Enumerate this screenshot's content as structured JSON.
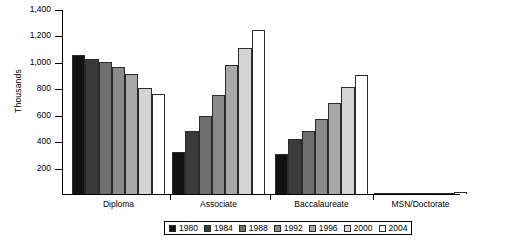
{
  "chart_data": {
    "type": "bar",
    "title": "",
    "xlabel": "",
    "ylabel": "Thousands",
    "ylim": [
      0,
      1400
    ],
    "ytick_step": 200,
    "grid": false,
    "legend_position": "bottom",
    "categories": [
      "Diploma",
      "Associate",
      "Baccalaureate",
      "MSN/Doctorate"
    ],
    "ytick_labels": [
      "1,400",
      "1,200",
      "1,000",
      "800",
      "600",
      "400",
      "200"
    ],
    "ytick_values": [
      1400,
      1200,
      1000,
      800,
      600,
      400,
      200
    ],
    "series": [
      {
        "name": "1980",
        "color": "#121212",
        "values": [
          1050,
          315,
          305,
          4
        ]
      },
      {
        "name": "1984",
        "color": "#3a3a3a",
        "values": [
          1020,
          480,
          415,
          5
        ]
      },
      {
        "name": "1988",
        "color": "#6e6e6e",
        "values": [
          1000,
          590,
          480,
          6
        ]
      },
      {
        "name": "1992",
        "color": "#8a8a8a",
        "values": [
          960,
          750,
          570,
          7
        ]
      },
      {
        "name": "1996",
        "color": "#a8a8a8",
        "values": [
          910,
          980,
          690,
          9
        ]
      },
      {
        "name": "2000",
        "color": "#d4d4d4",
        "values": [
          805,
          1105,
          810,
          11
        ]
      },
      {
        "name": "2004",
        "color": "#ffffff",
        "values": [
          755,
          1240,
          900,
          14
        ]
      }
    ]
  }
}
